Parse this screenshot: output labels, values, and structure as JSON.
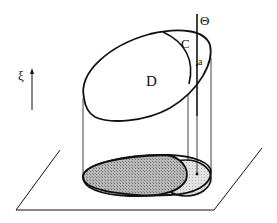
{
  "diagram": {
    "type": "3d-geometry-sketch",
    "labels": {
      "theta": "Θ",
      "c": "C",
      "a": "a",
      "d": "D",
      "xi": "ξ"
    },
    "colors": {
      "stroke": "#111111",
      "shade_dark": "#9a9a9a",
      "shade_light": "#d6d6d6",
      "background": "#ffffff"
    }
  }
}
